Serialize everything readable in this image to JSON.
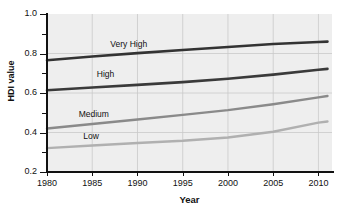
{
  "chart_data": {
    "type": "line",
    "title": "",
    "xlabel": "Year",
    "ylabel": "HDI value",
    "xlim": [
      1980,
      2011.5
    ],
    "ylim": [
      0.2,
      1.0
    ],
    "grid": true,
    "legend_position": "inline-labels",
    "x_ticks": [
      1980,
      1985,
      1990,
      1995,
      2000,
      2005,
      2010
    ],
    "y_ticks": [
      0.2,
      0.4,
      0.6,
      0.8,
      1.0
    ],
    "y_minor_ticks": [
      0.3,
      0.5,
      0.7,
      0.9
    ],
    "x": [
      1980,
      1985,
      1990,
      1995,
      2000,
      2005,
      2010,
      2011
    ],
    "series": [
      {
        "name": "Very High",
        "color": "#333333",
        "width": 2.6,
        "values": [
          0.766,
          0.785,
          0.802,
          0.818,
          0.833,
          0.848,
          0.858,
          0.86
        ]
      },
      {
        "name": "High",
        "color": "#3a3a3a",
        "width": 2.6,
        "values": [
          0.614,
          0.628,
          0.641,
          0.655,
          0.672,
          0.693,
          0.718,
          0.722
        ]
      },
      {
        "name": "Medium",
        "color": "#8a8a8a",
        "width": 2.4,
        "values": [
          0.42,
          0.443,
          0.466,
          0.489,
          0.513,
          0.543,
          0.578,
          0.585
        ]
      },
      {
        "name": "Low",
        "color": "#b0b0b0",
        "width": 2.4,
        "values": [
          0.321,
          0.334,
          0.347,
          0.358,
          0.375,
          0.404,
          0.45,
          0.456
        ]
      }
    ],
    "annotations": [
      {
        "text": "Very High",
        "x": 1987.0,
        "y": 0.845
      },
      {
        "text": "High",
        "x": 1985.5,
        "y": 0.69
      },
      {
        "text": "Medium",
        "x": 1983.5,
        "y": 0.487
      },
      {
        "text": "Low",
        "x": 1984.0,
        "y": 0.375
      }
    ]
  },
  "axis": {
    "y_tick_labels": [
      "1.0",
      "0.8",
      "0.6",
      "0.4",
      "0.2"
    ],
    "x_tick_labels": [
      "1980",
      "1985",
      "1990",
      "1995",
      "2000",
      "2005",
      "2010"
    ],
    "y_title": "HDI value",
    "x_title": "Year"
  },
  "colors": {
    "plot_background": "#eeeeee",
    "grid": "#c9c9c9",
    "axis": "#111111",
    "page_background": "#ffffff"
  }
}
